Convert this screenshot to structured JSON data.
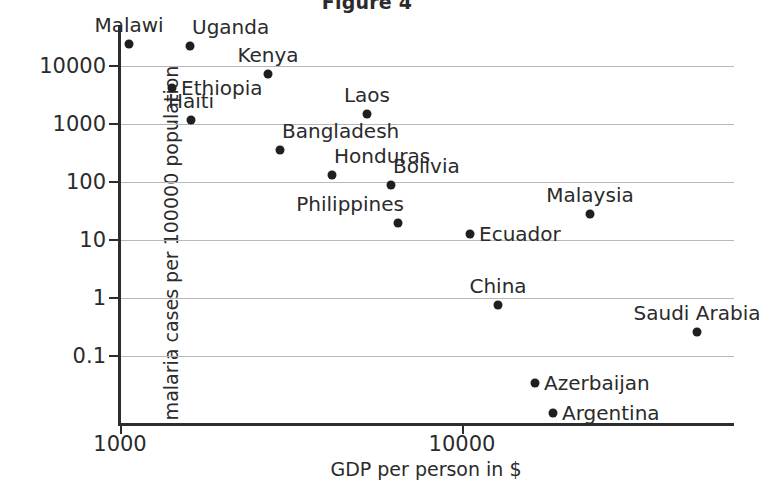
{
  "chart_data": {
    "type": "scatter",
    "title": "Figure 4",
    "xlabel": "GDP per person in $",
    "ylabel": "malaria cases per 100000 population",
    "xscale": "log",
    "yscale": "log",
    "xlim": [
      800,
      45000
    ],
    "ylim": [
      0.012,
      40000
    ],
    "grid": true,
    "legend": "none",
    "xticks": [
      {
        "value": 1000,
        "label": "1000"
      },
      {
        "value": 10000,
        "label": "10000"
      }
    ],
    "yticks": [
      {
        "value": 10000,
        "label": "10000"
      },
      {
        "value": 1000,
        "label": "1000"
      },
      {
        "value": 100,
        "label": "100"
      },
      {
        "value": 10,
        "label": "10"
      },
      {
        "value": 1,
        "label": "1"
      },
      {
        "value": 0.1,
        "label": "0.1"
      }
    ],
    "point_color": "#1f1f1f",
    "points": [
      {
        "name": "Malawi",
        "x": 1060,
        "y": 23000,
        "px": 129,
        "py": 44,
        "label_pos": "above"
      },
      {
        "name": "Uganda",
        "x": 1760,
        "y": 20000,
        "px": 190,
        "py": 46,
        "label_pos": "above-right"
      },
      {
        "name": "Kenya",
        "x": 2900,
        "y": 7800,
        "px": 268,
        "py": 74,
        "label_pos": "above"
      },
      {
        "name": "Ethiopia",
        "x": 1480,
        "y": 4200,
        "px": 172,
        "py": 88,
        "label_pos": "right"
      },
      {
        "name": "Haiti",
        "x": 1790,
        "y": 1200,
        "px": 191,
        "py": 120,
        "label_pos": "above"
      },
      {
        "name": "Laos",
        "x": 4200,
        "y": 1700,
        "px": 367,
        "py": 114,
        "label_pos": "above"
      },
      {
        "name": "Bangladesh",
        "x": 3100,
        "y": 390,
        "px": 280,
        "py": 150,
        "label_pos": "above-right"
      },
      {
        "name": "Honduras",
        "x": 4300,
        "y": 160,
        "px": 332,
        "py": 175,
        "label_pos": "above-right"
      },
      {
        "name": "Bolivia",
        "x": 6200,
        "y": 100,
        "px": 391,
        "py": 185,
        "label_pos": "above-right"
      },
      {
        "name": "Philippines",
        "x": 6400,
        "y": 25,
        "px": 398,
        "py": 223,
        "label_pos": "above-left"
      },
      {
        "name": "Ecuador",
        "x": 10500,
        "y": 16,
        "px": 470,
        "py": 234,
        "label_pos": "right"
      },
      {
        "name": "Malaysia",
        "x": 22500,
        "y": 35,
        "px": 590,
        "py": 214,
        "label_pos": "above"
      },
      {
        "name": "China",
        "x": 12600,
        "y": 0.95,
        "px": 498,
        "py": 305,
        "label_pos": "above"
      },
      {
        "name": "Saudi Arabia",
        "x": 40000,
        "y": 0.37,
        "px": 697,
        "py": 332,
        "label_pos": "above"
      },
      {
        "name": "Azerbaijan",
        "x": 16500,
        "y": 0.048,
        "px": 535,
        "py": 383,
        "label_pos": "right"
      },
      {
        "name": "Argentina",
        "x": 19000,
        "y": 0.021,
        "px": 553,
        "py": 413,
        "label_pos": "right"
      }
    ]
  }
}
